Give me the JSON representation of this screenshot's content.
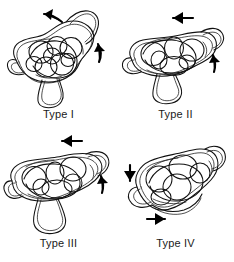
{
  "figure": {
    "title": "",
    "background_color": "#ffffff",
    "ink_color": "#111111",
    "arrow_color": "#000000",
    "panel_count": 4
  },
  "panels": [
    {
      "id": "type-i",
      "label": "Type I",
      "position": "top-left",
      "drawing_name": "vertebra-outline-type-i",
      "arrows": [
        {
          "name": "arrow-top-left",
          "direction": "left",
          "style": "curved",
          "x": 52,
          "y": 18
        },
        {
          "name": "arrow-right-up",
          "direction": "up",
          "style": "curved",
          "x": 98,
          "y": 52
        }
      ]
    },
    {
      "id": "type-ii",
      "label": "Type II",
      "position": "top-right",
      "drawing_name": "vertebra-outline-type-ii",
      "arrows": [
        {
          "name": "arrow-top-left",
          "direction": "left",
          "style": "straight",
          "x": 58,
          "y": 18
        },
        {
          "name": "arrow-right-up",
          "direction": "up",
          "style": "straight",
          "x": 96,
          "y": 58
        }
      ]
    },
    {
      "id": "type-iii",
      "label": "Type III",
      "position": "bottom-left",
      "drawing_name": "vertebra-outline-type-iii",
      "arrows": [
        {
          "name": "arrow-top-left",
          "direction": "left",
          "style": "straight",
          "x": 62,
          "y": 10
        },
        {
          "name": "arrow-right-up",
          "direction": "up",
          "style": "straight",
          "x": 101,
          "y": 48
        }
      ]
    },
    {
      "id": "type-iv",
      "label": "Type IV",
      "position": "bottom-right",
      "drawing_name": "vertebra-outline-type-iv",
      "arrows": [
        {
          "name": "arrow-left-down",
          "direction": "down",
          "style": "straight",
          "x": 15,
          "y": 45
        },
        {
          "name": "arrow-bottom-right",
          "direction": "right",
          "style": "straight",
          "x": 44,
          "y": 88
        }
      ]
    }
  ]
}
